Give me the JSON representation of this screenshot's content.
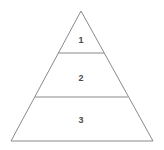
{
  "figure": {
    "kind": "pyramid-diagram",
    "background_color": "#ffffff",
    "stroke_color": "#8a8a8a",
    "label_color": "#4a4a4a",
    "stroke_width": 1,
    "apex": {
      "x": 81,
      "y": 11
    },
    "base_left": {
      "x": 11,
      "y": 141
    },
    "base_right": {
      "x": 153,
      "y": 141
    }
  },
  "tiers": [
    {
      "id": "tier-1",
      "label": "1",
      "label_x": 81,
      "label_y": 40,
      "divider": {
        "y": 53,
        "x1": 58,
        "x2": 104
      }
    },
    {
      "id": "tier-2",
      "label": "2",
      "label_x": 81,
      "label_y": 78,
      "divider": {
        "y": 97,
        "x1": 35,
        "x2": 128
      }
    },
    {
      "id": "tier-3",
      "label": "3",
      "label_x": 81,
      "label_y": 120,
      "divider": null
    }
  ]
}
